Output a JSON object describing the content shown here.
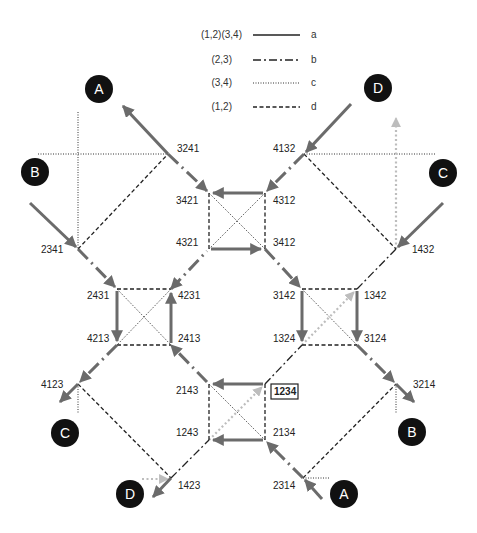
{
  "legend": [
    {
      "label": "(1,2)(3,4)",
      "style": "solid",
      "key": "a"
    },
    {
      "label": "(2,3)",
      "style": "dash-dot",
      "key": "b"
    },
    {
      "label": "(3,4)",
      "style": "dotted",
      "key": "c"
    },
    {
      "label": "(1,2)",
      "style": "dashed",
      "key": "d"
    }
  ],
  "circles": {
    "top_a": "A",
    "top_d": "D",
    "left_b": "B",
    "right_c": "C",
    "bottom_c": "C",
    "bottom_b": "B",
    "bottom_d": "D",
    "bottom_a": "A"
  },
  "nodes": {
    "n3241": "3241",
    "n4132": "4132",
    "n2341": "2341",
    "n1432": "1432",
    "n3421": "3421",
    "n4312": "4312",
    "n4321": "4321",
    "n3412": "3412",
    "n2431": "2431",
    "n4231": "4231",
    "n4213": "4213",
    "n2413": "2413",
    "n3142": "3142",
    "n1342": "1342",
    "n1324": "1324",
    "n3124": "3124",
    "n2143": "2143",
    "n1234": "1234",
    "n1243": "1243",
    "n2134": "2134",
    "n4123": "4123",
    "n3214": "3214",
    "n1423": "1423",
    "n2314": "2314"
  },
  "colors": {
    "thick_edge": "#6b6b6b",
    "thin_edge": "#222222",
    "highlight_edge": "#bdbdbd",
    "circle_fill": "#111111"
  }
}
